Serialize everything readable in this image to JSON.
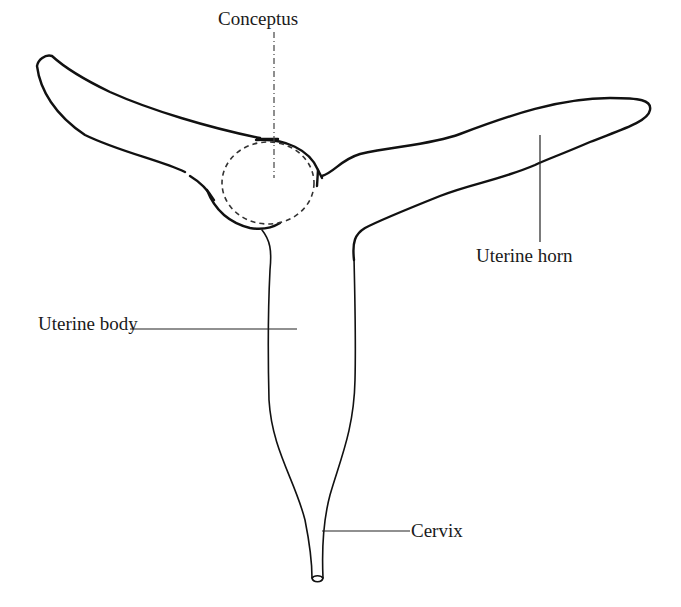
{
  "diagram": {
    "labels": {
      "conceptus": "Conceptus",
      "uterine_horn": "Uterine horn",
      "uterine_body": "Uterine body",
      "cervix": "Cervix"
    },
    "colors": {
      "stroke": "#111111",
      "background": "#ffffff"
    }
  }
}
